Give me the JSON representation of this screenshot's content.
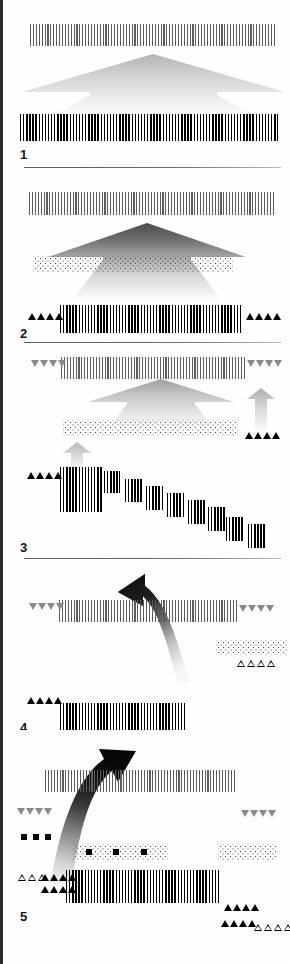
{
  "figure": {
    "domain": "geological-cross-section",
    "panel_count": 5,
    "background_color": "#fefefe",
    "ink_color": "#000000",
    "accent_gray": "#7d7d7d",
    "divider_color": "#5a5a5a"
  },
  "panels": [
    {
      "number": "1",
      "caption": "",
      "elements": [
        {
          "kind": "hatched-band",
          "role": "upper-crust-layer",
          "shade": "light"
        },
        {
          "kind": "gradient-wedge",
          "role": "rising-asthenosphere-arrow",
          "shade": "very-light"
        },
        {
          "kind": "hatched-band",
          "role": "lower-crust-layer",
          "shade": "dark"
        }
      ],
      "markers": []
    },
    {
      "number": "2",
      "caption": "",
      "elements": [
        {
          "kind": "hatched-band",
          "role": "upper-crust-layer",
          "shade": "light"
        },
        {
          "kind": "gradient-wedge",
          "role": "rising-asthenosphere-arrow",
          "shade": "dark"
        },
        {
          "kind": "stipple-band",
          "role": "sediment-layer",
          "shade": "medium"
        },
        {
          "kind": "hatched-band",
          "role": "lower-crust-layer",
          "shade": "dark"
        }
      ],
      "markers": [
        {
          "kind": "triangle-row",
          "fill": "black",
          "direction": "up",
          "count": 4,
          "side": "left"
        },
        {
          "kind": "triangle-row",
          "fill": "black",
          "direction": "up",
          "count": 4,
          "side": "right"
        }
      ]
    },
    {
      "number": "3",
      "caption": "",
      "elements": [
        {
          "kind": "hatched-band",
          "role": "upper-crust-layer",
          "shade": "light"
        },
        {
          "kind": "gradient-wedge",
          "role": "uplift-arrow",
          "shade": "light"
        },
        {
          "kind": "stipple-band",
          "role": "sediment-layer",
          "shade": "medium"
        },
        {
          "kind": "gradient-wedge",
          "role": "small-uplift-arrow-left",
          "shade": "light"
        },
        {
          "kind": "gradient-wedge",
          "role": "small-uplift-arrow-right",
          "shade": "light"
        },
        {
          "kind": "step-block-stack",
          "role": "faulted-basement-staircase",
          "block_count": 9
        }
      ],
      "markers": [
        {
          "kind": "triangle-row",
          "fill": "gray",
          "direction": "down",
          "count": 4,
          "side": "left"
        },
        {
          "kind": "triangle-row",
          "fill": "gray",
          "direction": "down",
          "count": 4,
          "side": "right"
        },
        {
          "kind": "triangle-row",
          "fill": "black",
          "direction": "up",
          "count": 4,
          "side": "right"
        },
        {
          "kind": "triangle-row",
          "fill": "black",
          "direction": "up",
          "count": 4,
          "side": "left"
        }
      ]
    },
    {
      "number": "4",
      "caption": "",
      "elements": [
        {
          "kind": "curved-arrow",
          "role": "subduction-rollback-arrow",
          "direction": "up-left"
        },
        {
          "kind": "hatched-band",
          "role": "upper-crust-layer",
          "shade": "light"
        },
        {
          "kind": "patterned-triangle",
          "role": "accretionary-prism"
        },
        {
          "kind": "stipple-band",
          "role": "sediment-layer",
          "shade": "light"
        },
        {
          "kind": "hatched-band",
          "role": "lower-crust-layer",
          "shade": "dark"
        }
      ],
      "markers": [
        {
          "kind": "triangle-row",
          "fill": "gray",
          "direction": "down",
          "count": 4,
          "side": "left"
        },
        {
          "kind": "triangle-row",
          "fill": "gray",
          "direction": "down",
          "count": 4,
          "side": "right"
        },
        {
          "kind": "triangle-row",
          "fill": "open",
          "direction": "up",
          "count": 4,
          "side": "right"
        },
        {
          "kind": "triangle-row",
          "fill": "black",
          "direction": "up",
          "count": 4,
          "side": "left"
        }
      ]
    },
    {
      "number": "5",
      "caption": "",
      "elements": [
        {
          "kind": "curved-arrow",
          "role": "slab-detachment-arrow",
          "direction": "up-right"
        },
        {
          "kind": "hatched-band",
          "role": "upper-crust-layer",
          "shade": "light"
        },
        {
          "kind": "square-row",
          "role": "ophiolite-markers",
          "count": 3
        },
        {
          "kind": "stipple-band",
          "role": "sediment-layer-with-ophiolites",
          "shade": "light",
          "inclusions": 3
        },
        {
          "kind": "stipple-band",
          "role": "sediment-layer-right",
          "shade": "light"
        },
        {
          "kind": "hatched-band",
          "role": "lower-crust-layer",
          "shade": "dark"
        }
      ],
      "markers": [
        {
          "kind": "triangle-row",
          "fill": "gray",
          "direction": "down",
          "count": 4,
          "side": "left"
        },
        {
          "kind": "triangle-row",
          "fill": "gray",
          "direction": "down",
          "count": 4,
          "side": "right"
        },
        {
          "kind": "triangle-row",
          "fill": "open",
          "direction": "up",
          "count": 3,
          "side": "left"
        },
        {
          "kind": "triangle-row",
          "fill": "black",
          "direction": "up",
          "count": 4,
          "side": "left"
        },
        {
          "kind": "triangle-row",
          "fill": "black",
          "direction": "up",
          "count": 4,
          "side": "left-lower"
        },
        {
          "kind": "triangle-row",
          "fill": "black",
          "direction": "up",
          "count": 4,
          "side": "right"
        },
        {
          "kind": "triangle-row",
          "fill": "black",
          "direction": "up",
          "count": 4,
          "side": "right-lower"
        },
        {
          "kind": "triangle-row",
          "fill": "open",
          "direction": "up",
          "count": 4,
          "side": "right-lower-outer"
        }
      ]
    }
  ]
}
